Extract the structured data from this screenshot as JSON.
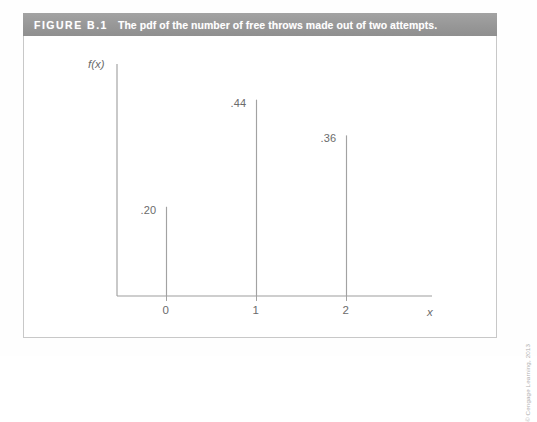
{
  "figure": {
    "number_label": "FIGURE B.1",
    "caption": "The pdf of the number of free throws made out of two attempts.",
    "header_bg": "#9b9b9b",
    "header_text_color": "#ffffff"
  },
  "copyright": "© Cengage Learning, 2013",
  "chart_data": {
    "type": "bar",
    "title": "The pdf of the number of free throws made out of two attempts.",
    "xlabel": "x",
    "ylabel": "f(x)",
    "categories": [
      "0",
      "1",
      "2"
    ],
    "values": [
      0.2,
      0.44,
      0.36
    ],
    "value_labels": [
      ".20",
      ".44",
      ".36"
    ],
    "tick_labels": [
      "0",
      "1",
      "2"
    ],
    "xlim": [
      -0.55,
      2.95
    ],
    "ylim": [
      0,
      0.52
    ],
    "grid": false,
    "legend": null,
    "style": "spike",
    "line_color": "#a2a2a2",
    "axis_color": "#9d9d9d"
  }
}
